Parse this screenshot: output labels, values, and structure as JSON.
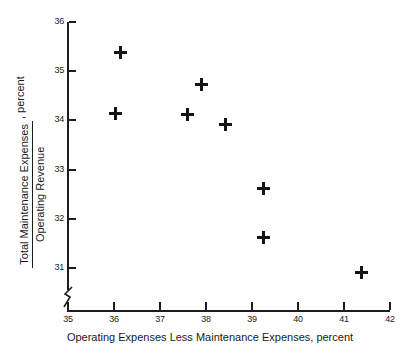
{
  "chart_data": {
    "type": "scatter",
    "title": "",
    "xlabel": "Operating Expenses Less Maintenance Expenses, percent",
    "ylabel_numerator": "Total Maintenance Expenses",
    "ylabel_denominator": "Operating Revenue",
    "ylabel_suffix": ", percent",
    "xlim": [
      35,
      42
    ],
    "ylim": [
      30.5,
      36
    ],
    "xticks": [
      "35",
      "36",
      "37",
      "38",
      "39",
      "40",
      "41",
      "42"
    ],
    "yticks": [
      "36",
      "35",
      "34",
      "33",
      "32",
      "31"
    ],
    "grid": false,
    "legend": null,
    "y_axis_break": true,
    "marker": "plus",
    "marker_color": "#141414",
    "points": [
      {
        "x": 36.15,
        "y": 35.37
      },
      {
        "x": 36.04,
        "y": 34.15
      },
      {
        "x": 37.59,
        "y": 34.13
      },
      {
        "x": 37.91,
        "y": 34.72
      },
      {
        "x": 38.43,
        "y": 33.91
      },
      {
        "x": 39.24,
        "y": 32.61
      },
      {
        "x": 39.24,
        "y": 31.63
      },
      {
        "x": 41.39,
        "y": 30.9
      }
    ]
  }
}
